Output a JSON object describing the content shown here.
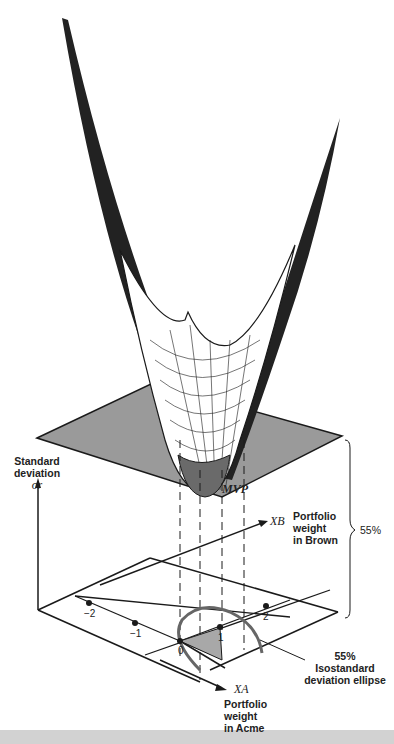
{
  "figure": {
    "surface": {
      "description": "portfolio standard deviation surface (wireframe bowl)"
    },
    "plane": {
      "fill": "#9a9a9a",
      "level_label": "55%"
    },
    "labels": {
      "y_axis_line1": "Standard",
      "y_axis_line2": "deviation",
      "y_axis_symbol": "σr",
      "mvp": "MVP",
      "xb_symbol": "XB",
      "xb_line1": "Portfolio",
      "xb_line2": "weight",
      "xb_line3": "in Brown",
      "xa_symbol": "XA",
      "xa_line1": "Portfolio",
      "xa_line2": "weight",
      "xa_line3": "in Acme",
      "brace_value": "55%",
      "ellipse_line1": "55%",
      "ellipse_line2": "Isostandard",
      "ellipse_line3": "deviation ellipse"
    },
    "ticks": [
      "−2",
      "−1",
      "0",
      "1",
      "2"
    ],
    "colors": {
      "ink": "#1a1a1a",
      "plane": "#9a9a9a",
      "ellipse": "#666666",
      "shade": "#a8a8a8"
    }
  }
}
